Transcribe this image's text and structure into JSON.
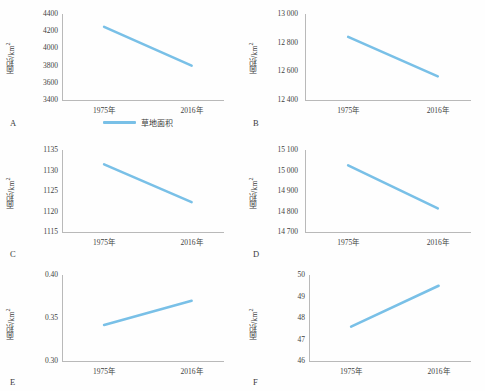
{
  "figure": {
    "background": "#fefefe",
    "line_color": "#79c0e7",
    "axis_color": "#b9b9b9",
    "text_color": "#3a3a3a"
  },
  "legend": {
    "label": "草地面积",
    "swatch_color": "#79c0e7"
  },
  "chart_data": [
    {
      "type": "line",
      "panel": "A",
      "panel_label": "A",
      "title": "",
      "xlabel": "",
      "ylabel": "面积/km²",
      "categories": [
        "1975年",
        "2016年"
      ],
      "values": [
        4250,
        3800
      ],
      "yticks": [
        "3400",
        "3600",
        "3800",
        "4000",
        "4200",
        "4400"
      ],
      "ytickvals": [
        3400,
        3600,
        3800,
        4000,
        4200,
        4400
      ],
      "ylim": [
        3400,
        4400
      ],
      "grid": false,
      "legend": "草地面积"
    },
    {
      "type": "line",
      "panel": "B",
      "panel_label": "B",
      "title": "",
      "xlabel": "",
      "ylabel": "面积/km²",
      "categories": [
        "1975年",
        "2016年"
      ],
      "values": [
        12840,
        12565
      ],
      "yticks": [
        "12 400",
        "12 600",
        "12 800",
        "13 000"
      ],
      "ytickvals": [
        12400,
        12600,
        12800,
        13000
      ],
      "ylim": [
        12400,
        13000
      ],
      "grid": false
    },
    {
      "type": "line",
      "panel": "C",
      "panel_label": "C",
      "title": "",
      "xlabel": "",
      "ylabel": "面积/km²",
      "categories": [
        "1975年",
        "2016年"
      ],
      "values": [
        1131.5,
        1122.3
      ],
      "yticks": [
        "1115",
        "1120",
        "1125",
        "1130",
        "1135"
      ],
      "ytickvals": [
        1115,
        1120,
        1125,
        1130,
        1135
      ],
      "ylim": [
        1115,
        1135
      ],
      "grid": false
    },
    {
      "type": "line",
      "panel": "D",
      "panel_label": "D",
      "title": "",
      "xlabel": "",
      "ylabel": "面积/km²",
      "categories": [
        "1975年",
        "2016年"
      ],
      "values": [
        15025,
        14815
      ],
      "yticks": [
        "14 700",
        "14 800",
        "14 900",
        "15 000",
        "15 100"
      ],
      "ytickvals": [
        14700,
        14800,
        14900,
        15000,
        15100
      ],
      "ylim": [
        14700,
        15100
      ],
      "grid": false
    },
    {
      "type": "line",
      "panel": "E",
      "panel_label": "E",
      "title": "",
      "xlabel": "",
      "ylabel": "面积/km²",
      "categories": [
        "1975年",
        "2016年"
      ],
      "values": [
        0.342,
        0.37
      ],
      "yticks": [
        "0.30",
        "0.35",
        "0.40"
      ],
      "ytickvals": [
        0.3,
        0.35,
        0.4
      ],
      "ylim": [
        0.3,
        0.4
      ],
      "grid": false
    },
    {
      "type": "line",
      "panel": "F",
      "panel_label": "F",
      "title": "",
      "xlabel": "",
      "ylabel": "面积/km²",
      "categories": [
        "1975年",
        "2016年"
      ],
      "values": [
        47.6,
        49.5
      ],
      "yticks": [
        "46",
        "47",
        "48",
        "49",
        "50"
      ],
      "ytickvals": [
        46,
        47,
        48,
        49,
        50
      ],
      "ylim": [
        46,
        50
      ],
      "grid": false
    }
  ]
}
